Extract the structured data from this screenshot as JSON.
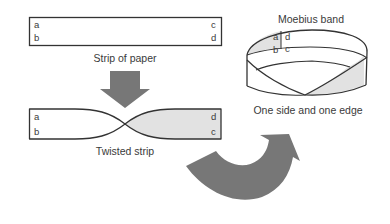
{
  "diagram": {
    "strip": {
      "caption": "Strip of paper",
      "labels": {
        "top_left": "a",
        "bottom_left": "b",
        "top_right": "c",
        "bottom_right": "d"
      }
    },
    "twisted": {
      "caption": "Twisted strip",
      "labels": {
        "top_left": "a",
        "bottom_left": "b",
        "top_right": "d",
        "bottom_right": "c"
      }
    },
    "moebius": {
      "title": "Moebius band",
      "caption": "One side and one edge",
      "labels": {
        "left_top": "a",
        "left_bottom": "b",
        "right_top": "d",
        "right_bottom": "c"
      }
    },
    "colors": {
      "outline": "#333333",
      "arrow": "#777777",
      "shade": "#e2e2e2",
      "text": "#3a3a3a"
    }
  }
}
